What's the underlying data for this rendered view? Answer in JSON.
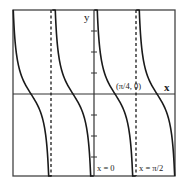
{
  "graph": {
    "function": "y = cot(2x)",
    "axis_labels": {
      "x": "x",
      "y": "y"
    },
    "point_label": "(π/4, 0)",
    "asymptote_labels": {
      "zero": "x = 0",
      "half_pi": "x = π/2"
    },
    "colors": {
      "curve": "#1a1a1a",
      "axis": "#333333",
      "frame": "#444444",
      "background": "#ffffff"
    },
    "frame": {
      "left": 13,
      "top": 10,
      "right": 175,
      "bottom": 176
    },
    "origin_px": {
      "x": 94,
      "y": 94
    },
    "px_per_quarter_pi": 21,
    "y_ticks_px": [
      31,
      52,
      73,
      115,
      136,
      157
    ],
    "dashed_asymptotes_px": [
      51,
      136
    ],
    "solid_asymptotes_px": [
      13,
      94,
      175
    ]
  },
  "chart_data": {
    "type": "line",
    "title": "",
    "series": [
      {
        "name": "y = cot(2x)",
        "formula": "cot(2x)"
      }
    ],
    "xlabel": "x",
    "ylabel": "y",
    "annotations": [
      "(π/4, 0)",
      "x = 0",
      "x = π/2"
    ],
    "x_zeros": [
      "-3π/4",
      "-π/4",
      "π/4",
      "3π/4"
    ],
    "asymptotes": [
      "-π",
      "-π/2",
      "0",
      "π/2",
      "π"
    ],
    "period": "π/2",
    "grid": false
  }
}
